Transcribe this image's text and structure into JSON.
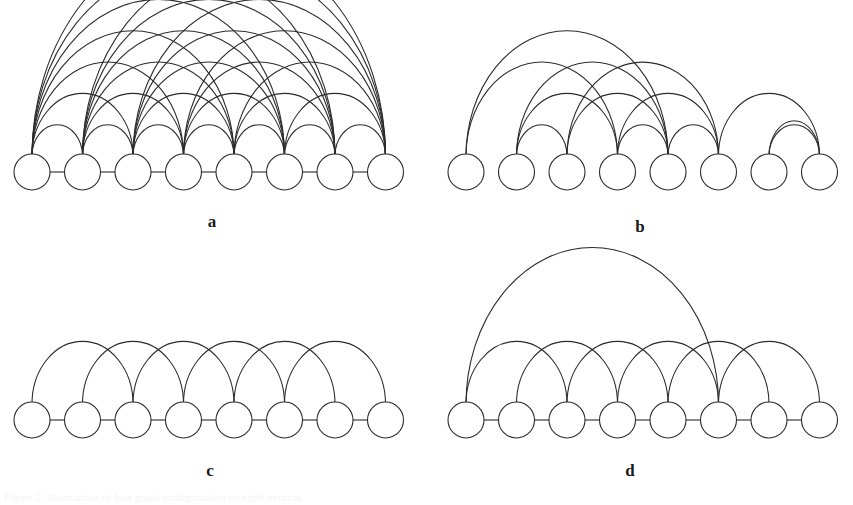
{
  "figure": {
    "background_color": "#ffffff",
    "stroke_color": "#2b2b2b",
    "node_fill_color": "#ffffff",
    "node_count_per_panel": 8,
    "caption": "Figure 2. Illustrations of four graph configurations on eight vertices."
  },
  "labels": {
    "a": "a",
    "b": "b",
    "c": "c",
    "d": "d"
  },
  "panels": [
    {
      "id": "a",
      "label": "a",
      "description": "complete graph on 8 nodes, all pairs joined by arcs",
      "origin_x": 14,
      "origin_y": 172,
      "node_spacing": 50.5,
      "node_radius": 18,
      "label_x": 200,
      "label_y": 213,
      "has_spine": true,
      "arc_height_scale": 0.62,
      "edges": [
        [
          1,
          2
        ],
        [
          1,
          3
        ],
        [
          1,
          4
        ],
        [
          1,
          5
        ],
        [
          1,
          6
        ],
        [
          1,
          7
        ],
        [
          1,
          8
        ],
        [
          2,
          3
        ],
        [
          2,
          4
        ],
        [
          2,
          5
        ],
        [
          2,
          6
        ],
        [
          2,
          7
        ],
        [
          2,
          8
        ],
        [
          3,
          4
        ],
        [
          3,
          5
        ],
        [
          3,
          6
        ],
        [
          3,
          7
        ],
        [
          3,
          8
        ],
        [
          4,
          5
        ],
        [
          4,
          6
        ],
        [
          4,
          7
        ],
        [
          4,
          8
        ],
        [
          5,
          6
        ],
        [
          5,
          7
        ],
        [
          5,
          8
        ],
        [
          6,
          7
        ],
        [
          6,
          8
        ],
        [
          7,
          8
        ]
      ]
    },
    {
      "id": "b",
      "label": "b",
      "description": "random graph on 8 nodes with mixed-span arcs and no spine",
      "origin_x": 448,
      "origin_y": 172,
      "node_spacing": 50.5,
      "node_radius": 18,
      "label_x": 628,
      "label_y": 218,
      "has_spine": false,
      "arc_height_scale": 0.62,
      "edges": [
        [
          1,
          4
        ],
        [
          1,
          5
        ],
        [
          2,
          3
        ],
        [
          2,
          4
        ],
        [
          2,
          5
        ],
        [
          3,
          5
        ],
        [
          3,
          6
        ],
        [
          4,
          5
        ],
        [
          4,
          6
        ],
        [
          5,
          6
        ],
        [
          6,
          8
        ],
        [
          7,
          8
        ],
        [
          7,
          8
        ]
      ]
    },
    {
      "id": "c",
      "label": "c",
      "description": "circulant ring lattice: each node joined to its two nearest neighbours on each side",
      "origin_x": 14,
      "origin_y": 420,
      "node_spacing": 50.5,
      "node_radius": 18,
      "label_x": 198,
      "label_y": 462,
      "has_spine": true,
      "arc_height_scale": 0.62,
      "edges": [
        [
          1,
          3
        ],
        [
          2,
          4
        ],
        [
          3,
          5
        ],
        [
          4,
          6
        ],
        [
          5,
          7
        ],
        [
          6,
          8
        ]
      ]
    },
    {
      "id": "d",
      "label": "d",
      "description": "ring lattice with one long-range rewired shortcut from node 1 to node 6",
      "origin_x": 448,
      "origin_y": 420,
      "node_spacing": 50.5,
      "node_radius": 18,
      "label_x": 618,
      "label_y": 462,
      "has_spine": true,
      "arc_height_scale": 0.62,
      "edges": [
        [
          1,
          3
        ],
        [
          2,
          4
        ],
        [
          3,
          5
        ],
        [
          4,
          6
        ],
        [
          5,
          7
        ],
        [
          6,
          8
        ],
        [
          1,
          6
        ]
      ]
    }
  ]
}
